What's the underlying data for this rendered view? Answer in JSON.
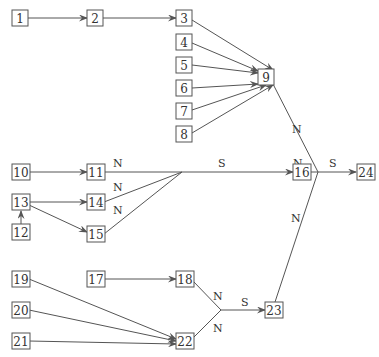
{
  "diagram": {
    "nodes": [
      {
        "id": "1",
        "label": "1",
        "x": 20,
        "y": 18
      },
      {
        "id": "2",
        "label": "2",
        "x": 95,
        "y": 18
      },
      {
        "id": "3",
        "label": "3",
        "x": 184,
        "y": 18
      },
      {
        "id": "4",
        "label": "4",
        "x": 184,
        "y": 42
      },
      {
        "id": "5",
        "label": "5",
        "x": 184,
        "y": 65
      },
      {
        "id": "6",
        "label": "6",
        "x": 184,
        "y": 88
      },
      {
        "id": "7",
        "label": "7",
        "x": 184,
        "y": 111
      },
      {
        "id": "8",
        "label": "8",
        "x": 184,
        "y": 134
      },
      {
        "id": "9",
        "label": "9",
        "x": 266,
        "y": 76
      },
      {
        "id": "10",
        "label": "10",
        "x": 21,
        "y": 172
      },
      {
        "id": "11",
        "label": "11",
        "x": 96,
        "y": 172
      },
      {
        "id": "13",
        "label": "13",
        "x": 21,
        "y": 202
      },
      {
        "id": "14",
        "label": "14",
        "x": 96,
        "y": 202
      },
      {
        "id": "12",
        "label": "12",
        "x": 21,
        "y": 232
      },
      {
        "id": "15",
        "label": "15",
        "x": 96,
        "y": 234
      },
      {
        "id": "16",
        "label": "16",
        "x": 302,
        "y": 172
      },
      {
        "id": "24",
        "label": "24",
        "x": 366,
        "y": 172
      },
      {
        "id": "19",
        "label": "19",
        "x": 21,
        "y": 279
      },
      {
        "id": "17",
        "label": "17",
        "x": 96,
        "y": 279
      },
      {
        "id": "18",
        "label": "18",
        "x": 185,
        "y": 279
      },
      {
        "id": "20",
        "label": "20",
        "x": 21,
        "y": 310
      },
      {
        "id": "23",
        "label": "23",
        "x": 274,
        "y": 310
      },
      {
        "id": "21",
        "label": "21",
        "x": 21,
        "y": 341
      },
      {
        "id": "22",
        "label": "22",
        "x": 185,
        "y": 341
      }
    ],
    "edges": [
      {
        "from": "1",
        "to": "2",
        "label": ""
      },
      {
        "from": "2",
        "to": "3",
        "label": ""
      },
      {
        "from": "3",
        "to": "9",
        "label": ""
      },
      {
        "from": "4",
        "to": "9",
        "label": ""
      },
      {
        "from": "5",
        "to": "9",
        "label": ""
      },
      {
        "from": "6",
        "to": "9",
        "label": ""
      },
      {
        "from": "7",
        "to": "9",
        "label": ""
      },
      {
        "from": "8",
        "to": "9",
        "label": ""
      },
      {
        "from": "10",
        "to": "11",
        "label": ""
      },
      {
        "from": "13",
        "to": "14",
        "label": ""
      },
      {
        "from": "13",
        "to": "15",
        "label": ""
      },
      {
        "from": "12",
        "to": "13",
        "label": ""
      },
      {
        "from": "11",
        "to": "junction-a",
        "label": "N"
      },
      {
        "from": "14",
        "to": "junction-a",
        "label": "N"
      },
      {
        "from": "15",
        "to": "junction-a",
        "label": "N"
      },
      {
        "from": "junction-a",
        "to": "16",
        "label": "S"
      },
      {
        "from": "16",
        "to": "junction-b",
        "label": "N"
      },
      {
        "from": "9",
        "to": "junction-b",
        "label": "N"
      },
      {
        "from": "23",
        "to": "junction-b",
        "label": "N"
      },
      {
        "from": "junction-b",
        "to": "24",
        "label": "S"
      },
      {
        "from": "17",
        "to": "18",
        "label": ""
      },
      {
        "from": "19",
        "to": "22",
        "label": ""
      },
      {
        "from": "20",
        "to": "22",
        "label": ""
      },
      {
        "from": "21",
        "to": "22",
        "label": ""
      },
      {
        "from": "18",
        "to": "junction-c",
        "label": "N"
      },
      {
        "from": "22",
        "to": "junction-c",
        "label": "N"
      },
      {
        "from": "junction-c",
        "to": "23",
        "label": "S"
      }
    ],
    "edge_labels": {
      "n_11": "N",
      "n_14": "N",
      "n_15": "N",
      "s_16": "S",
      "n_16": "N",
      "n_9": "N",
      "n_23": "N",
      "s_24": "S",
      "n_18": "N",
      "n_22": "N",
      "s_23": "S"
    }
  }
}
